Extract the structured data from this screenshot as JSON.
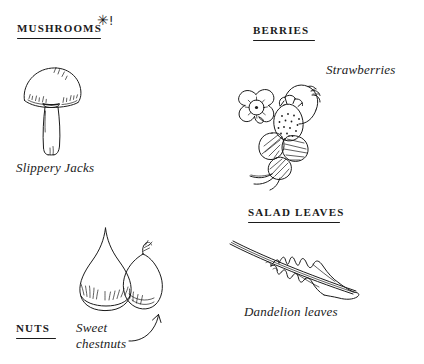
{
  "page": {
    "background_color": "#ffffff",
    "ink_color": "#1b1b1b"
  },
  "sections": [
    {
      "key": "mushrooms",
      "heading": "MUSHROOMS",
      "marker": {
        "star": "✳",
        "bang": "!"
      },
      "caption": "Slippery Jacks",
      "illustration": "mushroom-drawing"
    },
    {
      "key": "berries",
      "heading": "BERRIES",
      "caption": "Strawberries",
      "illustration": "strawberry-plant-drawing"
    },
    {
      "key": "nuts",
      "heading": "NUTS",
      "caption": "Sweet\nchestnuts",
      "illustration": "sweet-chestnut-drawing",
      "pointer": "curved-arrow-up"
    },
    {
      "key": "salad_leaves",
      "heading": "SALAD LEAVES",
      "caption": "Dandelion leaves",
      "illustration": "dandelion-leaf-drawing"
    }
  ]
}
